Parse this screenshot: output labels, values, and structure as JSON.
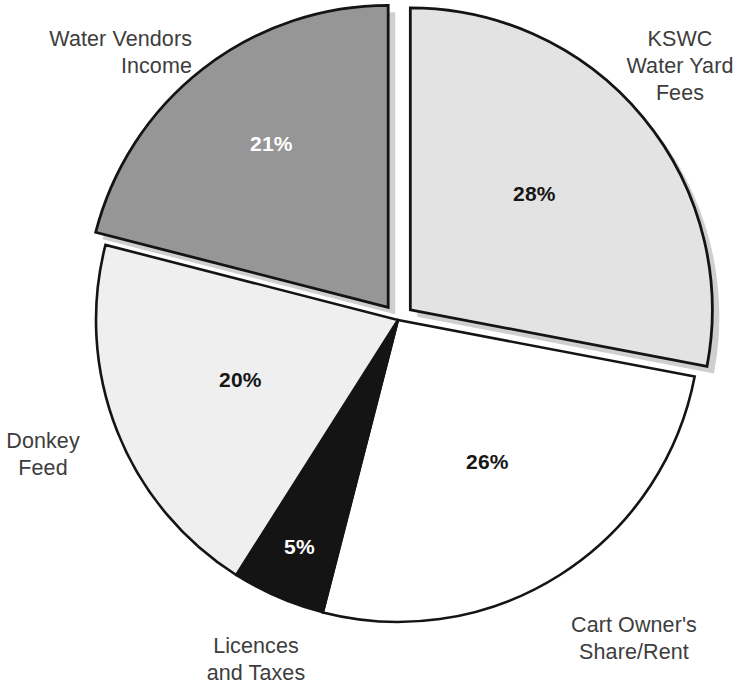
{
  "chart_data": {
    "type": "pie",
    "title": "",
    "subtitle": "",
    "xlabel": "",
    "ylabel": "",
    "legend_position": "none",
    "grid": false,
    "units": "percent",
    "total": 100,
    "categories": [
      "KSWC Water Yard Fees",
      "Cart Owner's Share/Rent",
      "Licences and Taxes",
      "Donkey Feed",
      "Water Vendors Income"
    ],
    "values": [
      28,
      26,
      5,
      20,
      21
    ],
    "slices": [
      {
        "name": "KSWC Water Yard Fees",
        "label_lines": "KSWC\nWater Yard\nFees",
        "value": 28,
        "value_label": "28%",
        "fill": "#e3e3e3",
        "stroke": "#141414",
        "text_color": "#161616",
        "exploded": true,
        "start_angle": 0,
        "end_angle": 100.8
      },
      {
        "name": "Cart Owner's Share/Rent",
        "label_lines": "Cart Owner's\nShare/Rent",
        "value": 26,
        "value_label": "26%",
        "fill": "#ffffff",
        "stroke": "#141414",
        "text_color": "#161616",
        "exploded": false,
        "start_angle": 100.8,
        "end_angle": 194.4
      },
      {
        "name": "Licences and Taxes",
        "label_lines": "Licences\nand Taxes",
        "value": 5,
        "value_label": "5%",
        "fill": "#141414",
        "stroke": "#141414",
        "text_color": "#ffffff",
        "exploded": false,
        "start_angle": 194.4,
        "end_angle": 212.4
      },
      {
        "name": "Donkey Feed",
        "label_lines": "Donkey\nFeed",
        "value": 20,
        "value_label": "20%",
        "fill": "#efefef",
        "stroke": "#141414",
        "text_color": "#161616",
        "exploded": false,
        "start_angle": 212.4,
        "end_angle": 284.4
      },
      {
        "name": "Water Vendors Income",
        "label_lines": "Water Vendors\nIncome",
        "value": 21,
        "value_label": "21%",
        "fill": "#969696",
        "stroke": "#141414",
        "text_color": "#ffffff",
        "exploded": true,
        "start_angle": 284.4,
        "end_angle": 360
      }
    ]
  },
  "labels": {
    "water_vendors": "Water Vendors\nIncome",
    "kswc": "KSWC\nWater Yard\nFees",
    "donkey": "Donkey\nFeed",
    "licences": "Licences\nand Taxes",
    "cart_owner": "Cart Owner's\nShare/Rent"
  },
  "percentages": {
    "water_vendors": "21%",
    "kswc": "28%",
    "cart_owner": "26%",
    "donkey": "20%",
    "licences": "5%"
  },
  "colors": {
    "water_vendors_fill": "#969696",
    "kswc_fill": "#e3e3e3",
    "cart_owner_fill": "#ffffff",
    "licences_fill": "#141414",
    "donkey_fill": "#efefef",
    "outline": "#141414",
    "background": "#ffffff",
    "shadow": "#cfcfcf"
  }
}
